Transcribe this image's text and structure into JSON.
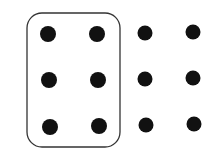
{
  "diagram": {
    "dot_color": "#111111",
    "outline_color": "#333333",
    "rows": 3,
    "columns": 4,
    "grouped_columns": 2,
    "total_dots": 12,
    "grouped_dots": 6
  }
}
